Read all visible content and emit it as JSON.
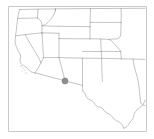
{
  "map": {
    "title": "Southwestern United States reference map",
    "region": "Western and Southwestern United States",
    "background_color": "#ffffff",
    "frame": {
      "name": "map frame",
      "color": "#c9c9c9",
      "x": 8,
      "y": 6,
      "width": 138,
      "height": 125
    },
    "boundary_style": {
      "state_line_color": "#9a9a9a",
      "coastline_color": "#9a9a9a",
      "line_width": 0.6
    },
    "marker": {
      "name": "location marker",
      "label": "",
      "color": "#8f8f8f",
      "edge_color": "#6d6d6d",
      "radius": 3,
      "x": 65,
      "y": 81,
      "state": "Arizona"
    },
    "coast_specks": [
      {
        "x": 21,
        "y": 66,
        "r": 0.7
      },
      {
        "x": 23,
        "y": 68,
        "r": 0.6
      },
      {
        "x": 25,
        "y": 70,
        "r": 0.5
      },
      {
        "x": 22,
        "y": 71,
        "r": 0.5
      },
      {
        "x": 26,
        "y": 73,
        "r": 0.6
      }
    ],
    "states_visible": [
      "Washington",
      "Oregon",
      "Idaho",
      "Montana",
      "North Dakota",
      "South Dakota",
      "Wyoming",
      "Nebraska",
      "Nevada",
      "Utah",
      "Colorado",
      "Kansas",
      "California",
      "Arizona",
      "New Mexico",
      "Oklahoma",
      "Texas"
    ]
  }
}
